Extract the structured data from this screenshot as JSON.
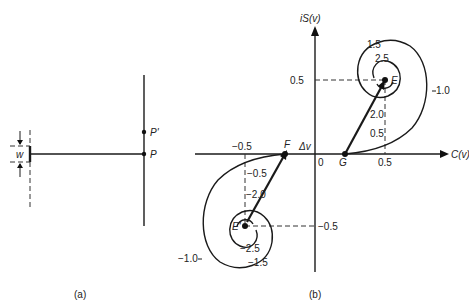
{
  "panel_a": {
    "caption": "(a)",
    "labels": {
      "width": "w",
      "point_p": "P",
      "point_p_prime": "P'"
    }
  },
  "panel_b": {
    "caption": "(b)",
    "axes": {
      "y_label": "iS(v)",
      "x_label": "C(v)",
      "origin": "0"
    },
    "ticks": {
      "x_pos": "0.5",
      "x_neg": "−0.5",
      "y_pos": "0.5",
      "y_neg": "−0.5"
    },
    "points": {
      "E": "E",
      "E_prime": "E'",
      "F": "F",
      "G": "G"
    },
    "delta": "Δv",
    "spiral_labels_upper": [
      "1.5",
      "2.5",
      "1.0",
      "2.0",
      "0.5"
    ],
    "spiral_labels_lower": [
      "−0.5",
      "−2.0",
      "−1.0",
      "−2.5",
      "−1.5"
    ]
  }
}
